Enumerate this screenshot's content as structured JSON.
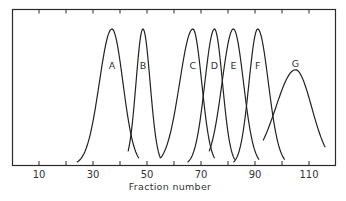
{
  "chart_data": {
    "type": "line",
    "title": "",
    "xlabel": "Fraction number",
    "ylabel": "",
    "xlim": [
      0,
      120
    ],
    "ylim": [
      0,
      1
    ],
    "grid": false,
    "legend": "none (peaks labeled inline)",
    "x_tick_labels": [
      "10",
      "30",
      "50",
      "70",
      "90",
      "110"
    ],
    "x_ticks": [
      10,
      20,
      30,
      40,
      50,
      60,
      70,
      80,
      90,
      100,
      110
    ],
    "series": [
      {
        "name": "A",
        "peak_fraction": 37,
        "start_fraction": 24,
        "end_fraction": 47,
        "peak_height": 1.0,
        "start_height": 0.02,
        "end_height": 0.05
      },
      {
        "name": "B",
        "peak_fraction": 48.5,
        "start_fraction": 43,
        "end_fraction": 55,
        "peak_height": 1.0,
        "start_height": 0.1,
        "end_height": 0.05
      },
      {
        "name": "C",
        "peak_fraction": 67,
        "start_fraction": 55,
        "end_fraction": 75,
        "peak_height": 1.0,
        "start_height": 0.05,
        "end_height": 0.05
      },
      {
        "name": "D",
        "peak_fraction": 75,
        "start_fraction": 65,
        "end_fraction": 82.5,
        "peak_height": 1.0,
        "start_height": 0.02,
        "end_height": 0.04
      },
      {
        "name": "E",
        "peak_fraction": 82,
        "start_fraction": 73,
        "end_fraction": 91.5,
        "peak_height": 1.0,
        "start_height": 0.1,
        "end_height": 0.04
      },
      {
        "name": "F",
        "peak_fraction": 91,
        "start_fraction": 82,
        "end_fraction": 101,
        "peak_height": 1.0,
        "start_height": 0.02,
        "end_height": 0.04
      },
      {
        "name": "G",
        "peak_fraction": 105,
        "start_fraction": 93,
        "end_fraction": 116,
        "peak_height": 0.7,
        "start_height": 0.18,
        "end_height": 0.13
      }
    ]
  },
  "labels": {
    "xlabel": "Fraction number",
    "ticks": [
      "10",
      "30",
      "50",
      "70",
      "90",
      "110"
    ],
    "peaks": [
      "A",
      "B",
      "C",
      "D",
      "E",
      "F",
      "G"
    ]
  }
}
